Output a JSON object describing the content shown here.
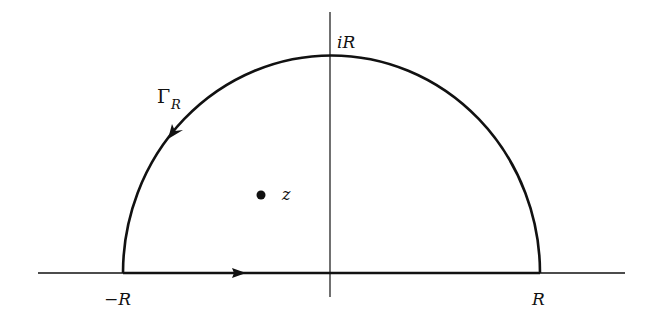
{
  "diagram": {
    "labels": {
      "top": "iR",
      "left": "−R",
      "right": "R",
      "contour_gamma": "Γ",
      "contour_sub": "R",
      "point": "z"
    },
    "colors": {
      "stroke": "#111111",
      "background": "#ffffff"
    }
  }
}
